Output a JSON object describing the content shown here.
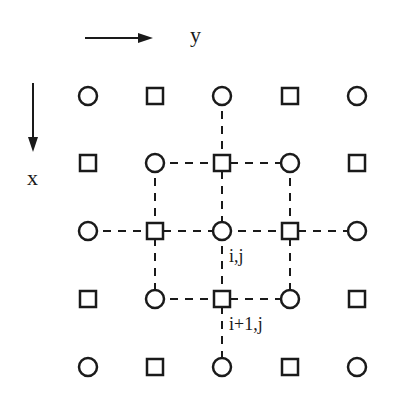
{
  "axes": {
    "y_label": "y",
    "x_label": "x"
  },
  "grid": {
    "rows": [
      [
        "circle",
        "square",
        "circle",
        "square",
        "circle"
      ],
      [
        "square",
        "circle",
        "square",
        "circle",
        "square"
      ],
      [
        "circle",
        "square",
        "circle",
        "square",
        "circle"
      ],
      [
        "square",
        "circle",
        "square",
        "circle",
        "square"
      ],
      [
        "circle",
        "square",
        "circle",
        "square",
        "circle"
      ]
    ],
    "col_x": [
      88,
      155,
      222,
      290,
      357
    ],
    "row_y": [
      96,
      163,
      231,
      299,
      367
    ]
  },
  "labels": {
    "center": "i,j",
    "below_center": "i+1,j"
  },
  "colors": {
    "stroke": "#1a1a1a",
    "background": "#ffffff"
  }
}
